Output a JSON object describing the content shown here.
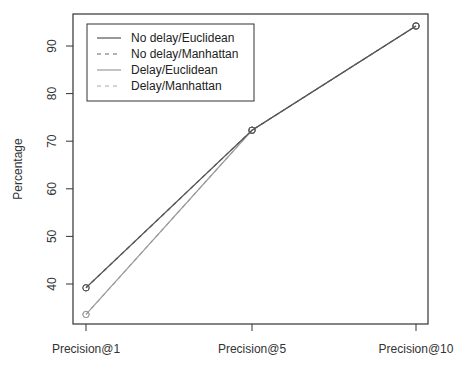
{
  "chart_data": {
    "type": "line",
    "title": "",
    "xlabel": "",
    "ylabel": "Percentage",
    "categories": [
      "Precision@1",
      "Precision@5",
      "Precision@10"
    ],
    "yticks": [
      40,
      50,
      60,
      70,
      80,
      90
    ],
    "ylim": [
      31,
      96
    ],
    "grid": false,
    "legend_position": "top-left",
    "series": [
      {
        "name": "No delay/Euclidean",
        "values": [
          39.2,
          72.3,
          94.2
        ],
        "style": "solid",
        "color": "#555555"
      },
      {
        "name": "No delay/Manhattan",
        "values": [
          39.2,
          72.3,
          94.2
        ],
        "style": "dashed",
        "color": "#666666"
      },
      {
        "name": "Delay/Euclidean",
        "values": [
          33.6,
          72.3,
          94.2
        ],
        "style": "solid",
        "color": "#9a9a9a"
      },
      {
        "name": "Delay/Manhattan",
        "values": [
          33.6,
          72.3,
          94.2
        ],
        "style": "dashed",
        "color": "#aaaaaa"
      }
    ]
  },
  "axis": {
    "ylabel": "Percentage",
    "yticks": [
      "40",
      "50",
      "60",
      "70",
      "80",
      "90"
    ],
    "xticks": [
      "Precision@1",
      "Precision@5",
      "Precision@10"
    ]
  },
  "legend": {
    "items": [
      {
        "label": "No delay/Euclidean"
      },
      {
        "label": "No delay/Manhattan"
      },
      {
        "label": "Delay/Euclidean"
      },
      {
        "label": "Delay/Manhattan"
      }
    ]
  }
}
